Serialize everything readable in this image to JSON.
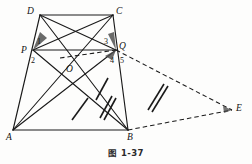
{
  "figure": {
    "caption": "图 1-37",
    "type": "plane-geometry-diagram",
    "stroke_color": "#1a1a1a",
    "background_color": "#fdfdfc"
  },
  "vertices": [
    {
      "name": "D",
      "label": "D",
      "x": 40,
      "y": 15,
      "label_x": 27,
      "label_y": 7
    },
    {
      "name": "C",
      "label": "C",
      "x": 113,
      "y": 15,
      "label_x": 116,
      "label_y": 7
    },
    {
      "name": "P",
      "label": "P",
      "x": 33,
      "y": 50,
      "label_x": 21,
      "label_y": 46
    },
    {
      "name": "Q",
      "label": "Q",
      "x": 116,
      "y": 50,
      "label_x": 119,
      "label_y": 42
    },
    {
      "name": "O",
      "label": "O",
      "x": 70,
      "y": 70,
      "label_x": 66,
      "label_y": 65
    },
    {
      "name": "A",
      "label": "A",
      "x": 13,
      "y": 130,
      "label_x": 6,
      "label_y": 133
    },
    {
      "name": "B",
      "label": "B",
      "x": 128,
      "y": 130,
      "label_x": 127,
      "label_y": 133
    },
    {
      "name": "E",
      "label": "E",
      "x": 232,
      "y": 110,
      "label_x": 236,
      "label_y": 104
    }
  ],
  "angle_labels": [
    {
      "name": "angle-1",
      "label": "1",
      "x": 37,
      "y": 38
    },
    {
      "name": "angle-2",
      "label": "2",
      "x": 31,
      "y": 57
    },
    {
      "name": "angle-3",
      "label": "3",
      "x": 104,
      "y": 38
    },
    {
      "name": "angle-4",
      "label": "4",
      "x": 110,
      "y": 57
    },
    {
      "name": "angle-5",
      "label": "5",
      "x": 120,
      "y": 57
    }
  ],
  "solid_segments": [
    {
      "name": "segment-DC",
      "from": "D",
      "to": "C"
    },
    {
      "name": "segment-AB",
      "from": "A",
      "to": "B"
    },
    {
      "name": "segment-AD",
      "from": "A",
      "to": "D"
    },
    {
      "name": "segment-BC",
      "from": "B",
      "to": "C"
    },
    {
      "name": "segment-DB",
      "from": "D",
      "to": "B"
    },
    {
      "name": "segment-AC",
      "from": "A",
      "to": "C"
    },
    {
      "name": "segment-DQ",
      "from": "D",
      "to": "Q"
    },
    {
      "name": "segment-CP",
      "from": "C",
      "to": "P"
    },
    {
      "name": "segment-PB",
      "from": "P",
      "to": "B"
    },
    {
      "name": "segment-QA",
      "from": "Q",
      "to": "A"
    },
    {
      "name": "segment-PQ-solid",
      "from": "P",
      "to": "Q"
    }
  ],
  "dashed_segments": [
    {
      "name": "segment-QE",
      "from": "Q",
      "to": "E"
    },
    {
      "name": "segment-BE",
      "from": "B",
      "to": "E"
    },
    {
      "name": "segment-PQ-dashed",
      "from": "P",
      "to": "Q"
    }
  ],
  "tick_marks": [
    {
      "name": "tick-single-left",
      "count": 1
    },
    {
      "name": "tick-single-right",
      "count": 1
    },
    {
      "name": "tick-double-mid",
      "count": 2
    },
    {
      "name": "tick-double-right",
      "count": 2
    }
  ]
}
